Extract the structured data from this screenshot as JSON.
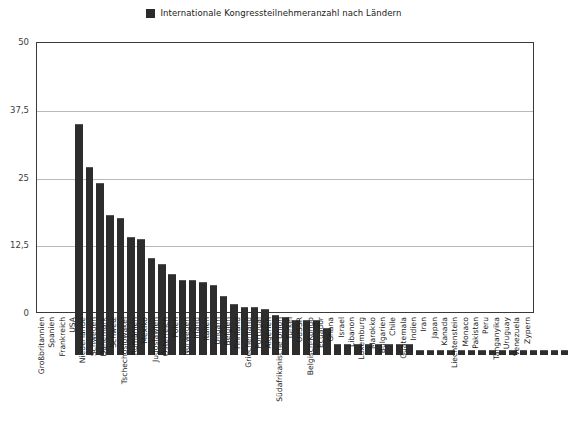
{
  "legend": {
    "swatch_color": "#2d2d2d",
    "label": "Internationale Kongressteilnehmeranzahl nach Ländern"
  },
  "chart_data": {
    "type": "bar",
    "title": "Internationale Kongressteilnehmeranzahl nach Ländern",
    "xlabel": "",
    "ylabel": "",
    "ylim": [
      0,
      50
    ],
    "yticks": [
      0,
      12.5,
      25,
      37.5,
      50
    ],
    "ytick_labels": [
      "0",
      "12,5",
      "25",
      "37,5",
      "50"
    ],
    "grid": true,
    "legend_position": "top-center",
    "bar_color": "#2d2d2d",
    "series_name": "Internationale Kongressteilnehmeranzahl nach Ländern",
    "categories": [
      "Großbritannien",
      "Spanien",
      "Frankreich",
      "USA",
      "Niederlande",
      "Schweden",
      "Dänemark",
      "Schweiz",
      "Tschechoslowakei",
      "Rumänien",
      "Mexiko",
      "Jugoslawien",
      "Österreich",
      "Polen",
      "Norwegen",
      "Irland",
      "Italien",
      "Ungarn",
      "Belgien",
      "Finnland",
      "Griechenland",
      "Portugal",
      "Algerien",
      "Südafrikanische Union",
      "Türkei",
      "UdSSR",
      "Belgisch-Kongo",
      "Ecuador",
      "Ghana",
      "Israel",
      "Libanon",
      "Luxemburg",
      "Marokko",
      "Bulgarien",
      "Chile",
      "Guatemala",
      "Indien",
      "Iran",
      "Japan",
      "Kanada",
      "Liechtenstein",
      "Monaco",
      "Pakistan",
      "Peru",
      "Tanganyika",
      "Uruguay",
      "Venezuela",
      "Zypern"
    ],
    "values": [
      43,
      35,
      32,
      26,
      25.5,
      22,
      21.5,
      18,
      17,
      15,
      14,
      14,
      13.5,
      13,
      11,
      9.5,
      9,
      9,
      8.5,
      7.5,
      7,
      6.5,
      6.5,
      6.5,
      5,
      2,
      2,
      2,
      2,
      2,
      2,
      2,
      2,
      1,
      1,
      1,
      1,
      1,
      1,
      1,
      1,
      1,
      1,
      1,
      1,
      1,
      1,
      1
    ]
  }
}
